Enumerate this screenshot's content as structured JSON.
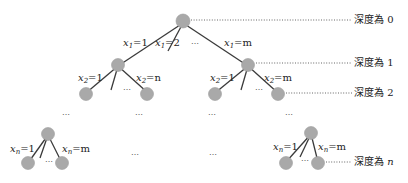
{
  "diagram": {
    "title": "",
    "node_color": "#a9a9a9",
    "edge_color": "#3a3a3a",
    "root": {
      "edge_labels": {
        "first": "x1=1",
        "second": "x1=2",
        "last": "x1=m",
        "var": "x",
        "sub": "1",
        "v_first": "=1",
        "v_second": "=2",
        "v_last": "=m"
      }
    },
    "level1_left": {
      "var": "x",
      "sub": "2",
      "v_first": "=1",
      "v_last": "=n"
    },
    "level1_right": {
      "var": "x",
      "sub": "2",
      "v_first": "=1",
      "v_last": "=m"
    },
    "bottom_left": {
      "var": "x",
      "sub": "n",
      "v_first": "=1",
      "v_last": "=m"
    },
    "bottom_right": {
      "var": "x",
      "sub": "n",
      "v_first": "=1",
      "v_last": "=m"
    },
    "ellipsis": "…",
    "ellipsis_dots": "⋯",
    "depth_labels": {
      "d0_text": "深度為 ",
      "d0_val": "0",
      "d1_text": "深度為 ",
      "d1_val": "1",
      "d2_text": "深度為 ",
      "d2_val": "2",
      "dn_text": "深度為 ",
      "dn_val": "n"
    }
  }
}
